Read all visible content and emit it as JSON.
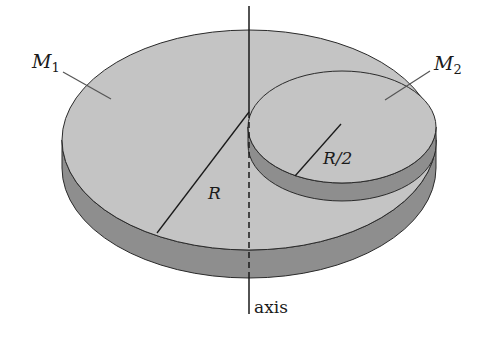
{
  "figure": {
    "colors": {
      "face": "#c4c4c4",
      "side": "#8e8e8e",
      "outline": "#2a2a2a",
      "leader": "#555555",
      "background": "#ffffff"
    }
  },
  "labels": {
    "m1_symbol": "M",
    "m1_sub": "1",
    "m2_symbol": "M",
    "m2_sub": "2",
    "radius_large": "R",
    "radius_small": "R/2",
    "axis": "axis"
  }
}
